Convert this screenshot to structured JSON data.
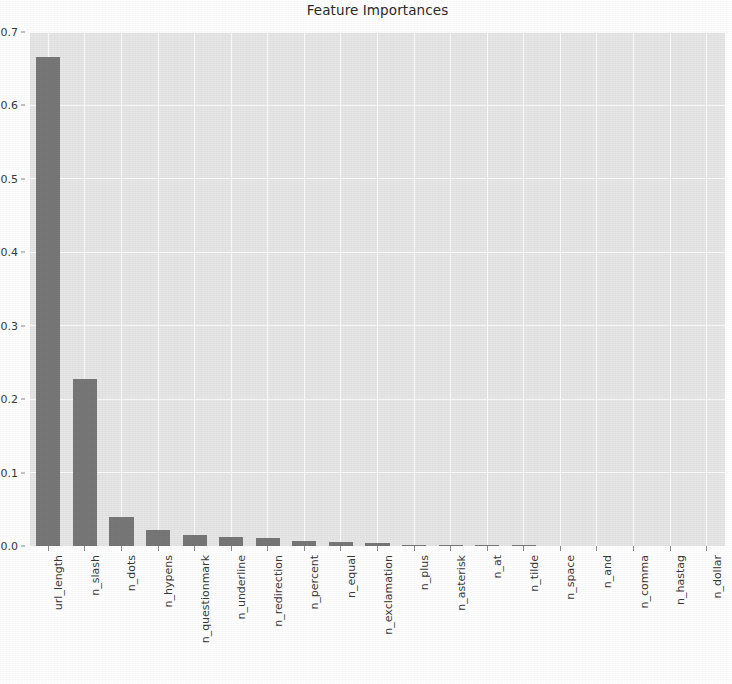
{
  "chart_data": {
    "type": "bar",
    "title": "Feature Importances",
    "xlabel": "",
    "ylabel": "",
    "ylim": [
      0.0,
      0.7
    ],
    "yticks": [
      "0.0",
      "0.1",
      "0.2",
      "0.3",
      "0.4",
      "0.5",
      "0.6",
      "0.7"
    ],
    "ytick_values": [
      0.0,
      0.1,
      0.2,
      0.3,
      0.4,
      0.5,
      0.6,
      0.7
    ],
    "grid": true,
    "legend": null,
    "orientation": "vertical",
    "bar_color": "#777777",
    "plot_background": "#e6e6e6",
    "grid_color": "#fbfbfb",
    "categories": [
      "url_length",
      "n_slash",
      "n_dots",
      "n_hypens",
      "n_questionmark",
      "n_underline",
      "n_redirection",
      "n_percent",
      "n_equal",
      "n_exclamation",
      "n_plus",
      "n_asterisk",
      "n_at",
      "n_tilde",
      "n_space",
      "n_and",
      "n_comma",
      "n_hastag",
      "n_dollar"
    ],
    "values": [
      0.666,
      0.228,
      0.039,
      0.022,
      0.015,
      0.012,
      0.011,
      0.007,
      0.006,
      0.004,
      0.002,
      0.002,
      0.001,
      0.001,
      0.0,
      0.0,
      0.0,
      0.0,
      0.0
    ]
  }
}
